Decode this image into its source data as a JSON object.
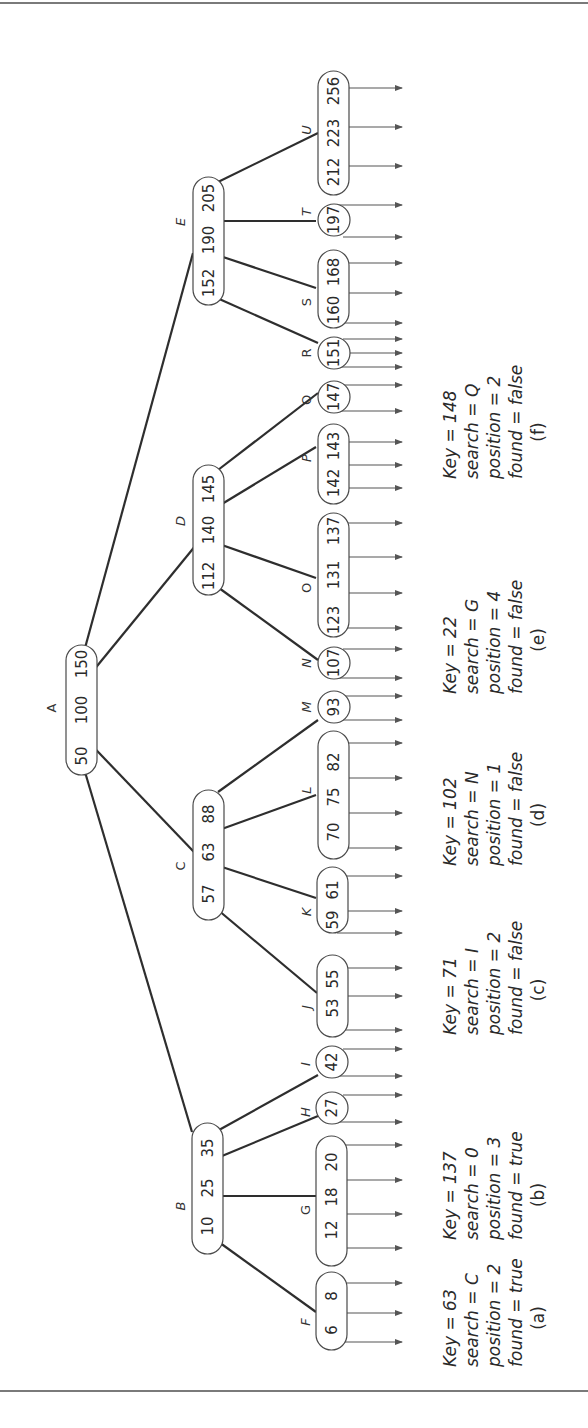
{
  "figure": {
    "orientation": "rotated-90-ccw",
    "colors": {
      "line": "#2e2e2e",
      "node_border": "#4a4a4a",
      "text": "#2a2a2a",
      "background": "#ffffff"
    },
    "root": {
      "label": "A",
      "keys": [
        "50",
        "100",
        "150"
      ]
    },
    "internal": [
      {
        "label": "B",
        "keys": [
          "10",
          "25",
          "35"
        ]
      },
      {
        "label": "C",
        "keys": [
          "57",
          "63",
          "88"
        ]
      },
      {
        "label": "D",
        "keys": [
          "112",
          "140",
          "145"
        ]
      },
      {
        "label": "E",
        "keys": [
          "152",
          "190",
          "205"
        ]
      }
    ],
    "leaves": [
      {
        "label": "F",
        "keys": [
          "6",
          "8"
        ]
      },
      {
        "label": "G",
        "keys": [
          "12",
          "18",
          "20"
        ]
      },
      {
        "label": "H",
        "keys": [
          "27"
        ]
      },
      {
        "label": "I",
        "keys": [
          "42"
        ]
      },
      {
        "label": "J",
        "keys": [
          "53",
          "55"
        ]
      },
      {
        "label": "K",
        "keys": [
          "59",
          "61"
        ]
      },
      {
        "label": "L",
        "keys": [
          "70",
          "75",
          "82"
        ]
      },
      {
        "label": "M",
        "keys": [
          "93"
        ]
      },
      {
        "label": "N",
        "keys": [
          "107"
        ]
      },
      {
        "label": "O",
        "keys": [
          "123",
          "131",
          "137"
        ]
      },
      {
        "label": "P",
        "keys": [
          "142",
          "143"
        ]
      },
      {
        "label": "Q",
        "keys": [
          "147"
        ]
      },
      {
        "label": "R",
        "keys": [
          "151"
        ]
      },
      {
        "label": "S",
        "keys": [
          "160",
          "168"
        ]
      },
      {
        "label": "T",
        "keys": [
          "197"
        ]
      },
      {
        "label": "U",
        "keys": [
          "212",
          "223",
          "256"
        ]
      }
    ],
    "captions": [
      {
        "id": "(a)",
        "key": "Key  =  63",
        "search": "search  =  C",
        "position": "position  =  2",
        "found": "found  =  true"
      },
      {
        "id": "(b)",
        "key": "Key  =  137",
        "search": "search  =  0",
        "position": "position  =  3",
        "found": "found  =  true"
      },
      {
        "id": "(c)",
        "key": "Key  =  71",
        "search": "search  =  I",
        "position": "position  =  2",
        "found": "found  =  false"
      },
      {
        "id": "(d)",
        "key": "Key  =  102",
        "search": "search  =  N",
        "position": "position  =  1",
        "found": "found  =  false"
      },
      {
        "id": "(e)",
        "key": "Key  =  22",
        "search": "search  =  G",
        "position": "position  =  4",
        "found": "found  =  false"
      },
      {
        "id": "(f)",
        "key": "Key  =  148",
        "search": "search  =  Q",
        "position": "position  =  2",
        "found": "found  =  false"
      }
    ]
  }
}
